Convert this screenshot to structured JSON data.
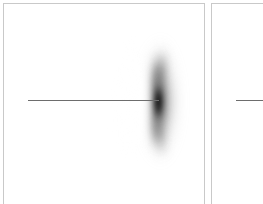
{
  "figure": {
    "background_color": "#ffffff",
    "panel_border_color": "#c9c9c9",
    "marker_line_color": "#6d6d6d",
    "blob_color": "#000000",
    "panels": [
      {
        "name": "left-panel",
        "has_blob": true,
        "has_marker_line": true,
        "marker_line_label": "",
        "blob_label": ""
      },
      {
        "name": "right-panel",
        "has_blob": false,
        "has_marker_line": true,
        "marker_line_label": "",
        "blob_label": ""
      }
    ]
  },
  "chart_data": {
    "type": "heatmap",
    "title": "",
    "subtitle": "",
    "xlabel": "",
    "ylabel": "",
    "xlim": [
      0,
      202
    ],
    "ylim": [
      0,
      204
    ],
    "grid": false,
    "legend": null,
    "tick_labels": {
      "x": [],
      "y": []
    },
    "panels": [
      {
        "name": "left-panel",
        "features": [
          {
            "kind": "crescent-blob",
            "description": "diffuse dark crescent, concave toward the left",
            "center_x": 156,
            "center_y": 99,
            "extent_x": [
              132,
              184
            ],
            "extent_y": [
              40,
              158
            ],
            "peak_intensity": 1.0,
            "core_x": [
              151,
              162
            ],
            "core_y": [
              82,
              118
            ]
          },
          {
            "kind": "horizontal-marker-line",
            "description": "thin horizontal line ending inside the blob core",
            "y": 100,
            "x_start": 28,
            "x_end": 159
          }
        ]
      },
      {
        "name": "right-panel",
        "features": [
          {
            "kind": "horizontal-marker-line",
            "description": "thin horizontal line, panel cropped by image edge",
            "y": 100,
            "x_start": 236,
            "x_end": 263
          }
        ]
      }
    ]
  }
}
